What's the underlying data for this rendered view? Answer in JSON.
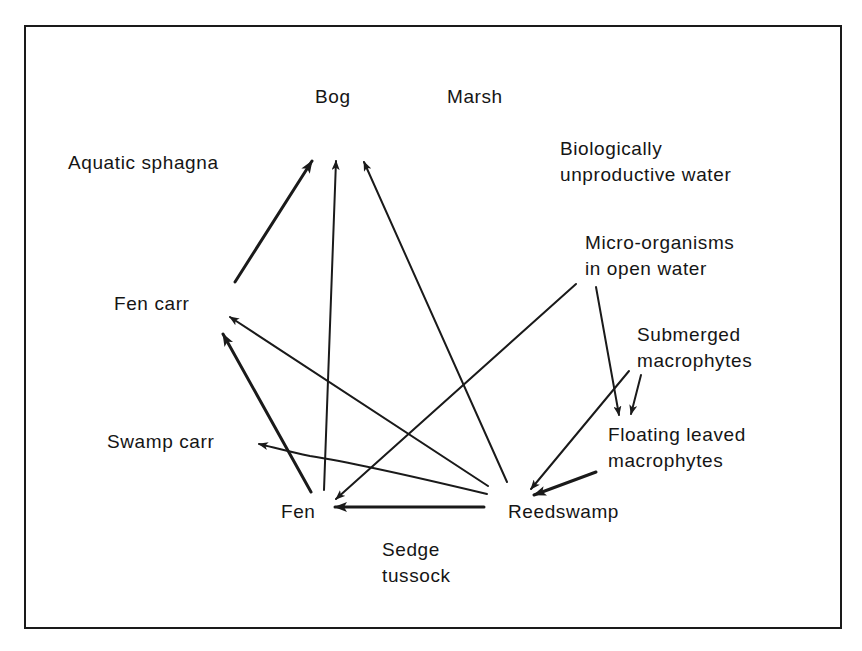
{
  "diagram": {
    "type": "succession-network",
    "nodes": [
      {
        "id": "bog",
        "label": "Bog",
        "lines": [
          "Bog"
        ]
      },
      {
        "id": "marsh",
        "label": "Marsh",
        "lines": [
          "Marsh"
        ]
      },
      {
        "id": "aquatic_sphagna",
        "label": "Aquatic sphagna",
        "lines": [
          "Aquatic sphagna"
        ]
      },
      {
        "id": "bio_unproductive_water",
        "label": "Biologically unproductive water",
        "lines": [
          "Biologically",
          "unproductive water"
        ]
      },
      {
        "id": "micro_organisms",
        "label": "Micro-organisms in open water",
        "lines": [
          "Micro-organisms",
          "in open water"
        ]
      },
      {
        "id": "fen_carr",
        "label": "Fen carr",
        "lines": [
          "Fen carr"
        ]
      },
      {
        "id": "submerged_macrophytes",
        "label": "Submerged macrophytes",
        "lines": [
          "Submerged",
          "macrophytes"
        ]
      },
      {
        "id": "swamp_carr",
        "label": "Swamp carr",
        "lines": [
          "Swamp carr"
        ]
      },
      {
        "id": "floating_leaved_macrophytes",
        "label": "Floating leaved macrophytes",
        "lines": [
          "Floating leaved",
          "macrophytes"
        ]
      },
      {
        "id": "fen",
        "label": "Fen",
        "lines": [
          "Fen"
        ]
      },
      {
        "id": "reedswamp",
        "label": "Reedswamp",
        "lines": [
          "Reedswamp"
        ]
      },
      {
        "id": "sedge_tussock",
        "label": "Sedge tussock",
        "lines": [
          "Sedge",
          "tussock"
        ]
      }
    ],
    "edges": [
      {
        "from": "fen_carr",
        "to": "bog",
        "weight": "thick"
      },
      {
        "from": "fen",
        "to": "bog",
        "weight": "normal"
      },
      {
        "from": "reedswamp",
        "to": "bog",
        "weight": "normal"
      },
      {
        "from": "fen",
        "to": "fen_carr",
        "weight": "thick"
      },
      {
        "from": "reedswamp",
        "to": "fen_carr",
        "weight": "normal"
      },
      {
        "from": "reedswamp",
        "to": "swamp_carr",
        "weight": "normal"
      },
      {
        "from": "micro_organisms",
        "to": "fen",
        "weight": "normal"
      },
      {
        "from": "micro_organisms",
        "to": "floating_leaved_macrophytes",
        "weight": "normal"
      },
      {
        "from": "submerged_macrophytes",
        "to": "floating_leaved_macrophytes",
        "weight": "normal"
      },
      {
        "from": "submerged_macrophytes",
        "to": "reedswamp",
        "weight": "normal"
      },
      {
        "from": "floating_leaved_macrophytes",
        "to": "reedswamp",
        "weight": "thick"
      },
      {
        "from": "reedswamp",
        "to": "fen",
        "weight": "thick"
      }
    ],
    "colors": {
      "ink": "#1a1a1a",
      "background": "#ffffff"
    }
  }
}
